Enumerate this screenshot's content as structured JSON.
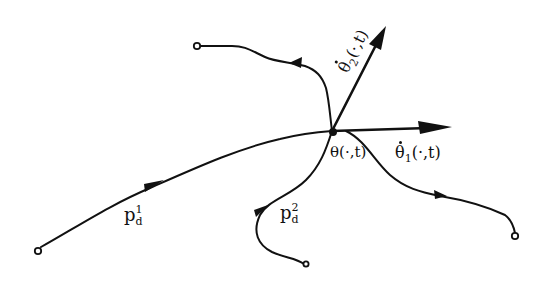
{
  "diagram": {
    "type": "hand-drawn trajectory diagram",
    "center_point": {
      "label": "θ(·,t)",
      "x": 332,
      "y": 131
    },
    "vectors": [
      {
        "id": "theta-dot-2",
        "label_main": "θ̇",
        "label_sub": "2",
        "label_args": "(·,t)",
        "from": [
          332,
          131
        ],
        "to": [
          384,
          28
        ]
      },
      {
        "id": "theta-dot-1",
        "label_main": "θ̇",
        "label_sub": "1",
        "label_args": "(·,t)",
        "from": [
          332,
          131
        ],
        "to": [
          450,
          128
        ]
      }
    ],
    "paths": [
      {
        "id": "pd1",
        "label_main": "p",
        "label_sub": "d",
        "label_sup": "1",
        "start": [
          38,
          250
        ],
        "end": [
          332,
          131
        ],
        "direction": "toward center"
      },
      {
        "id": "pd2",
        "label_main": "p",
        "label_sub": "d",
        "label_sup": "2",
        "start": [
          305,
          264
        ],
        "end": [
          332,
          131
        ],
        "direction": "toward center"
      },
      {
        "id": "upper-left",
        "start": [
          332,
          131
        ],
        "end": [
          197,
          45
        ],
        "direction": "away from center"
      },
      {
        "id": "lower-right",
        "start": [
          332,
          131
        ],
        "end": [
          515,
          236
        ],
        "direction": "away from center"
      }
    ],
    "colors": {
      "ink": "#111111",
      "background": "#ffffff"
    }
  },
  "labels": {
    "theta_center": "θ(·,t)",
    "theta_dot_1_main": "θ",
    "theta_dot_1_sub": "1",
    "theta_dot_1_args": "(·,t)",
    "theta_dot_2_main": "θ",
    "theta_dot_2_sub": "2",
    "theta_dot_2_args": "(·,t)",
    "pd1_main": "p",
    "pd1_sub": "d",
    "pd1_sup": "1",
    "pd2_main": "p",
    "pd2_sub": "d",
    "pd2_sup": "2"
  }
}
